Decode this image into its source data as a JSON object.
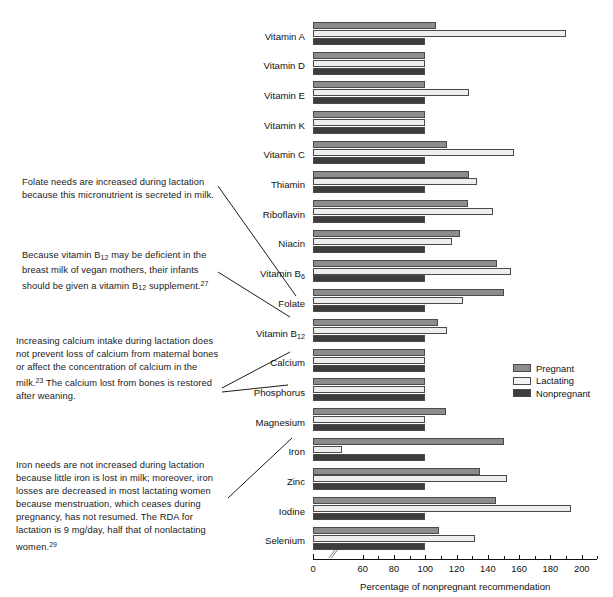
{
  "chart_data": {
    "type": "bar",
    "orientation": "horizontal",
    "title": "",
    "xlabel": "Percentage of nonpregnant recommendation",
    "ylabel": "",
    "xlim": [
      0,
      210
    ],
    "axis_break": true,
    "axis_break_after": 0,
    "grid": false,
    "legend_position": "right",
    "xticks": [
      0,
      60,
      80,
      100,
      120,
      140,
      160,
      180,
      200
    ],
    "xtick_labels": [
      "0",
      "60",
      "80",
      "100",
      "120",
      "140",
      "160",
      "180",
      "200"
    ],
    "categories": [
      "Vitamin A",
      "Vitamin D",
      "Vitamin E",
      "Vitamin K",
      "Vitamin C",
      "Thiamin",
      "Riboflavin",
      "Niacin",
      "Vitamin B6",
      "Folate",
      "Vitamin B12",
      "Calcium",
      "Phosphorus",
      "Magnesium",
      "Iron",
      "Zinc",
      "Iodine",
      "Selenium"
    ],
    "category_labels_html": [
      "Vitamin A",
      "Vitamin D",
      "Vitamin E",
      "Vitamin K",
      "Vitamin C",
      "Thiamin",
      "Riboflavin",
      "Niacin",
      "Vitamin B<sub>6</sub>",
      "Folate",
      "Vitamin B<sub>12</sub>",
      "Calcium",
      "Phosphorus",
      "Magnesium",
      "Iron",
      "Zinc",
      "Iodine",
      "Selenium"
    ],
    "series": [
      {
        "name": "Pregnant",
        "color": "#8c8c8c",
        "values": [
          107,
          100,
          100,
          100,
          114,
          128,
          127,
          122,
          146,
          150,
          108,
          100,
          100,
          113,
          150,
          135,
          145,
          109
        ]
      },
      {
        "name": "Lactating",
        "color": "#eeeeee",
        "values": [
          190,
          100,
          128,
          100,
          157,
          133,
          143,
          117,
          155,
          124,
          114,
          100,
          100,
          100,
          43,
          152,
          193,
          132
        ]
      },
      {
        "name": "Nonpregnant",
        "color": "#3d3d3d",
        "values": [
          100,
          100,
          100,
          100,
          100,
          100,
          100,
          100,
          100,
          100,
          100,
          100,
          100,
          100,
          100,
          100,
          100,
          100
        ]
      }
    ]
  },
  "legend": {
    "items": [
      {
        "label": "Pregnant",
        "swatch": "pregnant"
      },
      {
        "label": "Lactating",
        "swatch": "lactating"
      },
      {
        "label": "Nonpregnant",
        "swatch": "nonpregnant"
      }
    ]
  },
  "annotations": [
    {
      "id": "folate",
      "text": "Folate needs are increased during lactation because this micronutrient is secreted in milk.",
      "html": "Folate needs are increased during lactation because this micronutrient is secreted in milk."
    },
    {
      "id": "b12",
      "text": "Because vitamin B12 may be deficient in the breast milk of vegan mothers, their infants should be given a vitamin B12 supplement.27",
      "html": "Because vitamin B<sub>12</sub> may be deficient in the breast milk of vegan mothers, their infants should be given a vitamin B<sub>12</sub> supplement.<sup>27</sup>"
    },
    {
      "id": "calcium",
      "text": "Increasing calcium intake during lactation does not prevent loss of calcium from maternal bones or affect the concentration of calcium in the milk.23 The calcium lost from bones is restored after weaning.",
      "html": "Increasing calcium intake during lactation does not prevent loss of calcium from maternal bones or affect the concentration of calcium in the milk.<sup>23</sup> The calcium lost from bones is restored after weaning."
    },
    {
      "id": "iron",
      "text": "Iron needs are not increased during lactation because little iron is lost in milk; moreover, iron losses are decreased in most lactating women because menstruation, which ceases during pregnancy, has not resumed. The RDA for lactation is 9 mg/day, half that of nonlactating women.29",
      "html": "Iron needs are not increased during lactation because little iron is lost in milk; moreover, iron losses are decreased in most lactating women because menstruation, which ceases during pregnancy, has not resumed. The RDA for lactation is 9 mg/day, half that of nonlactating women.<sup>29</sup>"
    }
  ],
  "colors": {
    "pregnant": "#8c8c8c",
    "lactating": "#eeeeee",
    "nonpregnant": "#3d3d3d",
    "axis": "#111111",
    "background": "#ffffff"
  }
}
